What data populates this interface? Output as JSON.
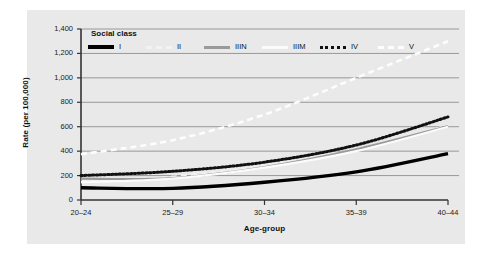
{
  "figure": {
    "panel_background": "#e9e9e9",
    "page_background": "#ffffff"
  },
  "legend": {
    "title": "Social class",
    "position": "inside-top-left",
    "entries": [
      {
        "label": "I",
        "style": "thick-solid",
        "color": "#000000"
      },
      {
        "label": "II",
        "style": "dashed",
        "color": "#f2f2f2"
      },
      {
        "label": "IIIN",
        "style": "solid",
        "color": "#9a9a9a"
      },
      {
        "label": "IIIM",
        "style": "solid",
        "color": "#fbfbfb"
      },
      {
        "label": "IV",
        "style": "dotted",
        "color": "#111111"
      },
      {
        "label": "V",
        "style": "dashed",
        "color": "#fdfdfd"
      }
    ]
  },
  "axes": {
    "y_title": "Rate (per 100,000)",
    "x_title": "Age-group",
    "y_ticks": [
      "0",
      "200",
      "400",
      "600",
      "800",
      "1,000",
      "1,200",
      "1,400"
    ],
    "x_ticks": [
      "20–24",
      "25–29",
      "30–34",
      "35–39",
      "40–44"
    ]
  },
  "chart_data": {
    "type": "line",
    "title": "",
    "xlabel": "Age-group",
    "ylabel": "Rate (per 100,000)",
    "categories": [
      "20–24",
      "25–29",
      "30–34",
      "35–39",
      "40–44"
    ],
    "ylim": [
      0,
      1400
    ],
    "ytick_step": 200,
    "grid": true,
    "legend_position": "upper-left-inside",
    "legend_title": "Social class",
    "series": [
      {
        "name": "I",
        "values": [
          100,
          95,
          145,
          230,
          380
        ],
        "style": "thick-solid",
        "color": "#000000"
      },
      {
        "name": "II",
        "values": [
          150,
          190,
          280,
          410,
          610
        ],
        "style": "dashed",
        "color": "#f2f2f2"
      },
      {
        "name": "IIIN",
        "values": [
          175,
          180,
          270,
          415,
          605
        ],
        "style": "solid",
        "color": "#9a9a9a"
      },
      {
        "name": "IIIM",
        "values": [
          145,
          175,
          265,
          400,
          600
        ],
        "style": "solid",
        "color": "#fbfbfb"
      },
      {
        "name": "IV",
        "values": [
          200,
          235,
          310,
          450,
          680
        ],
        "style": "dotted",
        "color": "#111111"
      },
      {
        "name": "V",
        "values": [
          375,
          490,
          700,
          1000,
          1300
        ],
        "style": "dashed",
        "color": "#fdfdfd"
      }
    ]
  }
}
